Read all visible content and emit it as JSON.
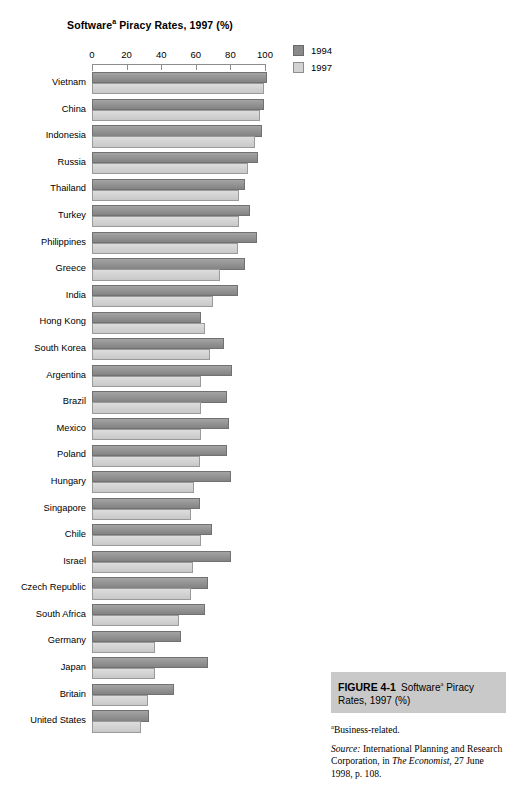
{
  "chart_data": {
    "type": "bar",
    "orientation": "horizontal",
    "title_main": "Software",
    "title_sup": "a",
    "title_rest": " Piracy Rates, 1997 (%)",
    "xlabel": "",
    "ylabel": "",
    "xlim": [
      0,
      100
    ],
    "xticks": [
      0,
      20,
      40,
      60,
      80,
      100
    ],
    "grid": false,
    "legend_position": "top-right",
    "categories": [
      "Vietnam",
      "China",
      "Indonesia",
      "Russia",
      "Thailand",
      "Turkey",
      "Philippines",
      "Greece",
      "India",
      "Hong Kong",
      "South Korea",
      "Argentina",
      "Brazil",
      "Mexico",
      "Poland",
      "Hungary",
      "Singapore",
      "Chile",
      "Israel",
      "Czech Republic",
      "South Africa",
      "Germany",
      "Japan",
      "Britain",
      "United States"
    ],
    "series": [
      {
        "name": "1994",
        "color": "#8a8a8a",
        "values": [
          100,
          98,
          97,
          95,
          87,
          90,
          94,
          87,
          83,
          62,
          75,
          80,
          77,
          78,
          77,
          79,
          61,
          68,
          79,
          66,
          64,
          50,
          66,
          46,
          32
        ]
      },
      {
        "name": "1997",
        "color": "#d3d3d3",
        "values": [
          98,
          96,
          93,
          89,
          84,
          84,
          83,
          73,
          69,
          64,
          67,
          62,
          62,
          62,
          61,
          58,
          56,
          62,
          57,
          56,
          49,
          35,
          35,
          31,
          27
        ]
      }
    ]
  },
  "legend": {
    "items": [
      {
        "label": "1994",
        "swatch": "dark-gray"
      },
      {
        "label": "1997",
        "swatch": "light-gray"
      }
    ]
  },
  "caption": {
    "figure_number": "FIGURE 4-1",
    "figure_title_main": "Software",
    "figure_title_sup": "a",
    "figure_title_rest": " Piracy Rates, 1997 (%)",
    "footnote_sup": "a",
    "footnote_text": "Business-related.",
    "source_label": "Source:",
    "source_text_1": " International Planning and Research Corporation, in ",
    "source_italic": "The Economist,",
    "source_text_2": " 27 June 1998, p. 108."
  },
  "colors": {
    "bar_1994": "#8a8a8a",
    "bar_1997": "#d3d3d3",
    "caption_header_bg": "#c9c9c9",
    "axis": "#8d8d8d"
  }
}
